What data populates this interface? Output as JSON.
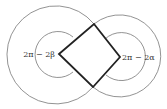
{
  "diagram": {
    "labels": {
      "left_angle": "2π − 2β",
      "right_angle": "2π − 2α"
    },
    "colors": {
      "background": "#ffffff",
      "thin_stroke": "#777777",
      "thick_stroke": "#222222",
      "text": "#333333"
    }
  }
}
